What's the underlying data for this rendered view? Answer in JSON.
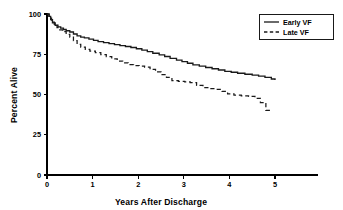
{
  "chart_data": {
    "type": "line",
    "title": "",
    "subtitle": "",
    "xlabel": "Years After Discharge",
    "ylabel": "Percent Alive",
    "xlim": [
      0,
      5.8
    ],
    "ylim": [
      0,
      100
    ],
    "xticks": [
      0,
      1,
      2,
      3,
      4,
      5
    ],
    "xtick_labels": [
      "0",
      "1",
      "2",
      "3",
      "4",
      "5"
    ],
    "yticks": [
      0,
      25,
      50,
      75,
      100
    ],
    "ytick_labels": [
      "0",
      "25",
      "50",
      "75",
      "100"
    ],
    "grid": false,
    "legend_position": "top-right",
    "legend_entries": [
      "Early VF",
      "Late VF"
    ],
    "annotations": [],
    "series": [
      {
        "name": "Early VF",
        "style": "solid",
        "color": "#1a1a1a",
        "x": [
          0.0,
          0.04,
          0.08,
          0.12,
          0.18,
          0.24,
          0.3,
          0.36,
          0.42,
          0.5,
          0.58,
          0.66,
          0.74,
          0.82,
          0.92,
          1.02,
          1.12,
          1.24,
          1.36,
          1.48,
          1.6,
          1.72,
          1.84,
          1.96,
          2.08,
          2.2,
          2.32,
          2.46,
          2.58,
          2.7,
          2.84,
          2.96,
          3.08,
          3.2,
          3.34,
          3.48,
          3.62,
          3.76,
          3.9,
          4.04,
          4.18,
          4.34,
          4.5,
          4.64,
          4.78,
          4.92,
          5.0
        ],
        "y": [
          100.0,
          98.5,
          96.5,
          94.5,
          93.0,
          92.0,
          91.2,
          90.4,
          89.6,
          88.8,
          87.6,
          86.4,
          85.6,
          85.2,
          84.4,
          83.6,
          82.8,
          82.2,
          81.6,
          81.0,
          80.4,
          79.8,
          79.2,
          78.4,
          77.6,
          76.6,
          75.6,
          74.6,
          73.6,
          72.4,
          71.4,
          70.4,
          69.4,
          68.4,
          67.6,
          66.8,
          66.0,
          65.2,
          64.4,
          63.8,
          63.2,
          62.6,
          62.0,
          61.4,
          60.6,
          59.6,
          59.0
        ]
      },
      {
        "name": "Late VF",
        "style": "dashed",
        "color": "#1a1a1a",
        "x": [
          0.0,
          0.05,
          0.1,
          0.16,
          0.22,
          0.28,
          0.34,
          0.42,
          0.5,
          0.58,
          0.66,
          0.74,
          0.84,
          0.94,
          1.06,
          1.18,
          1.3,
          1.42,
          1.54,
          1.66,
          1.78,
          1.9,
          2.02,
          2.14,
          2.26,
          2.38,
          2.5,
          2.62,
          2.74,
          2.88,
          3.02,
          3.14,
          3.28,
          3.42,
          3.56,
          3.7,
          3.84,
          3.96,
          4.1,
          4.26,
          4.42,
          4.56,
          4.68,
          4.8,
          4.94
        ],
        "y": [
          100.0,
          97.5,
          95.0,
          93.0,
          91.5,
          90.2,
          89.0,
          87.4,
          85.6,
          83.4,
          81.2,
          79.4,
          78.0,
          77.0,
          76.0,
          74.8,
          73.6,
          72.2,
          70.8,
          69.6,
          68.6,
          68.0,
          67.6,
          67.0,
          65.6,
          64.0,
          62.4,
          60.6,
          58.6,
          58.2,
          57.8,
          57.4,
          55.6,
          54.2,
          53.6,
          53.2,
          52.0,
          50.4,
          49.6,
          49.2,
          48.8,
          47.6,
          45.0,
          40.2,
          40.0
        ]
      }
    ]
  }
}
